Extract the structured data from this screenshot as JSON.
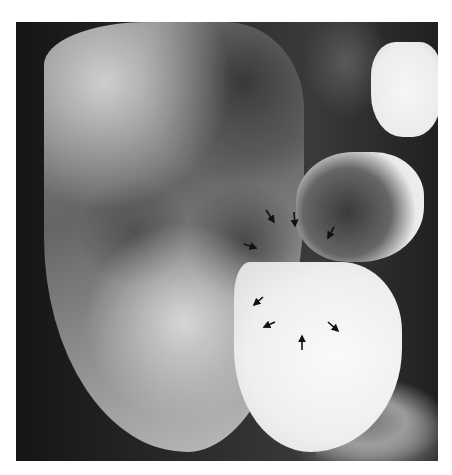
{
  "image": {
    "description": "Barium contrast radiograph of abdomen showing colon and stomach with black arrow annotations",
    "arrow_color": "#111111",
    "arrows": [
      {
        "x1": 250,
        "y1": 188,
        "x2": 258,
        "y2": 200
      },
      {
        "x1": 278,
        "y1": 190,
        "x2": 279,
        "y2": 204
      },
      {
        "x1": 318,
        "y1": 205,
        "x2": 312,
        "y2": 216
      },
      {
        "x1": 228,
        "y1": 222,
        "x2": 240,
        "y2": 226
      },
      {
        "x1": 247,
        "y1": 275,
        "x2": 238,
        "y2": 283
      },
      {
        "x1": 259,
        "y1": 300,
        "x2": 248,
        "y2": 305
      },
      {
        "x1": 312,
        "y1": 300,
        "x2": 322,
        "y2": 309
      },
      {
        "x1": 286,
        "y1": 328,
        "x2": 286,
        "y2": 314
      }
    ]
  }
}
